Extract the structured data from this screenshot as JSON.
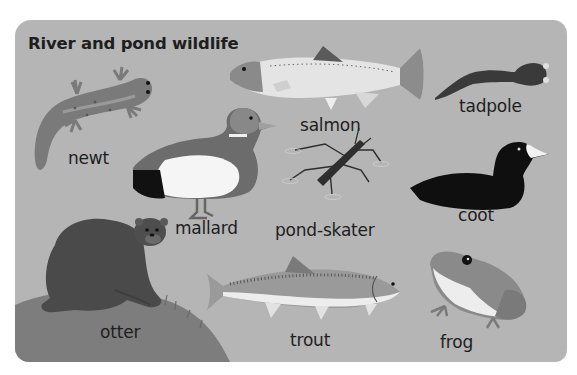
{
  "title": "River and pond wildlife",
  "animals": [
    {
      "name": "newt"
    },
    {
      "name": "salmon"
    },
    {
      "name": "tadpole"
    },
    {
      "name": "mallard"
    },
    {
      "name": "pond-skater"
    },
    {
      "name": "coot"
    },
    {
      "name": "otter"
    },
    {
      "name": "trout"
    },
    {
      "name": "frog"
    }
  ],
  "colors": {
    "background": "#ffffff",
    "card": "#b5b5b5",
    "text": "#1e1e1e"
  }
}
